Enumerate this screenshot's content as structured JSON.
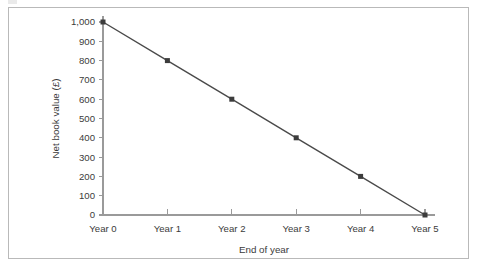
{
  "chart_data": {
    "type": "line",
    "title": "",
    "xlabel": "End of year",
    "ylabel": "Net book value (£)",
    "categories": [
      "Year 0",
      "Year 1",
      "Year 2",
      "Year 3",
      "Year 4",
      "Year 5"
    ],
    "values": [
      1000,
      800,
      600,
      400,
      200,
      0
    ],
    "series": [
      {
        "name": "Net book value",
        "values": [
          1000,
          800,
          600,
          400,
          200,
          0
        ]
      }
    ],
    "ylim": [
      0,
      1000
    ],
    "ytick_values": [
      0,
      100,
      200,
      300,
      400,
      500,
      600,
      700,
      800,
      900,
      1000
    ],
    "ytick_labels": [
      "0",
      "100",
      "200",
      "300",
      "400",
      "500",
      "600",
      "700",
      "800",
      "900",
      "1,000"
    ],
    "xtick_labels": [
      "Year 0",
      "Year 1",
      "Year 2",
      "Year 3",
      "Year 4",
      "Year 5"
    ],
    "grid": false,
    "legend": false,
    "legend_position": "none",
    "marker": "square",
    "colors": {
      "line": "#4a4a4a",
      "marker": "#3c3c3c",
      "axis": "#9a9a9a",
      "text": "#3b3b3b",
      "frame": "#b9b9b9",
      "background": "#ffffff"
    }
  }
}
